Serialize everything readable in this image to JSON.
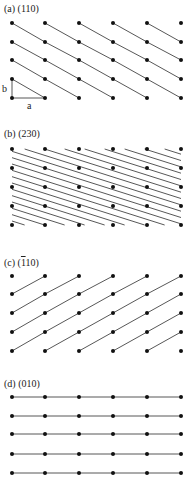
{
  "figure": {
    "line_color": "#444444",
    "dot_color": "#111111",
    "lattice": {
      "columns_x": [
        12,
        45,
        79,
        113,
        147,
        181
      ],
      "num_rows": 5
    },
    "panels": [
      {
        "id": "a",
        "label_prefix": "(a)",
        "label_miller": "(110)",
        "rows_y": [
          23,
          42,
          60,
          79,
          98
        ],
        "plane_type": "slope_down_1x1",
        "annotations": {
          "b_label": "b",
          "a_label": "a"
        }
      },
      {
        "id": "b",
        "label_prefix": "(b)",
        "label_miller": "(230)",
        "rows_y": [
          149,
          168,
          187,
          206,
          225
        ],
        "plane_type": "slope_down_dense"
      },
      {
        "id": "c",
        "label_prefix": "(c)",
        "label_miller_bar": "1",
        "label_miller_rest": "10)",
        "label_miller_open": "(",
        "rows_y": [
          276,
          294,
          313,
          332,
          351
        ],
        "plane_type": "slope_up_1x1"
      },
      {
        "id": "d",
        "label_prefix": "(d)",
        "label_miller": "(010)",
        "rows_y": [
          397,
          416,
          434,
          454,
          473
        ],
        "plane_type": "horizontal"
      }
    ]
  }
}
